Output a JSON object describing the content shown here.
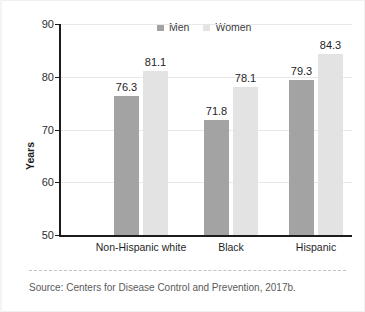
{
  "chart_data": {
    "type": "bar",
    "title": "",
    "xlabel": "",
    "ylabel": "Years",
    "ylim": [
      50,
      90
    ],
    "yticks": [
      50,
      60,
      70,
      80,
      90
    ],
    "grid": true,
    "grid_axis": "y",
    "legend_position": "top-center",
    "categories": [
      "Non-Hispanic white",
      "Black",
      "Hispanic"
    ],
    "series": [
      {
        "name": "Men",
        "color": "#a3a3a3",
        "values": [
          76.3,
          71.8,
          79.3
        ]
      },
      {
        "name": "Women",
        "color": "#e3e3e3",
        "values": [
          81.1,
          78.1,
          84.3
        ]
      }
    ],
    "value_labels": {
      "men": [
        "76.3",
        "71.8",
        "79.3"
      ],
      "women": [
        "81.1",
        "78.1",
        "84.3"
      ]
    },
    "source_note": "Source: Centers for Disease Control and Prevention, 2017b."
  },
  "axis": {
    "y_title": "Years",
    "y_tick_labels": [
      "90",
      "80",
      "70",
      "60",
      "50"
    ]
  },
  "legend": {
    "men_label": "Men",
    "women_label": "Women"
  },
  "categories": {
    "c0": "Non-Hispanic white",
    "c1": "Black",
    "c2": "Hispanic"
  },
  "values": {
    "g0_men": "76.3",
    "g0_women": "81.1",
    "g1_men": "71.8",
    "g1_women": "78.1",
    "g2_men": "79.3",
    "g2_women": "84.3"
  },
  "footer": {
    "source": "Source: Centers for Disease Control and Prevention, 2017b."
  },
  "colors": {
    "men": "#a3a3a3",
    "women": "#e3e3e3",
    "axis": "#1c1c1c",
    "grid": "#e8e8e8"
  }
}
